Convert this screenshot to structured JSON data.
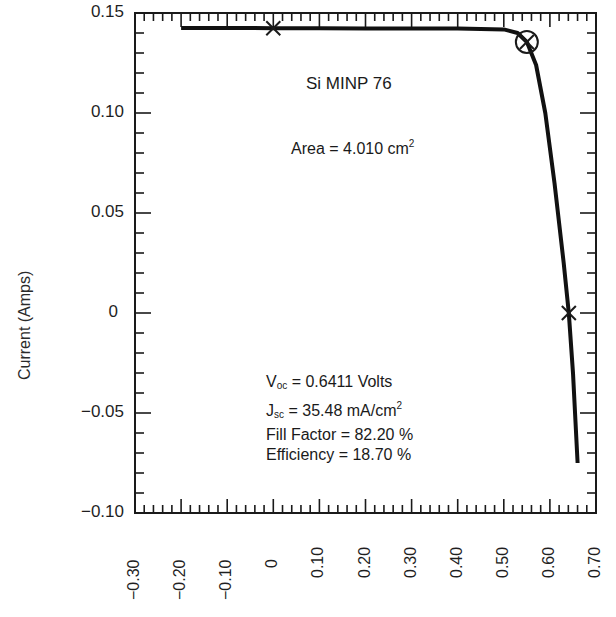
{
  "chart_data": {
    "type": "line",
    "title": "Si MINP 76",
    "xlabel": "",
    "ylabel": "Current (Amps)",
    "xlim": [
      -0.3,
      0.7
    ],
    "ylim": [
      -0.1,
      0.15
    ],
    "grid": false,
    "legend": null,
    "x_ticks": [
      "-0.30",
      "-0.20",
      "-0.10",
      "0",
      "0.10",
      "0.20",
      "0.30",
      "0.40",
      "0.50",
      "0.60",
      "0.70"
    ],
    "y_ticks": [
      "0.15",
      "0.10",
      "0.05",
      "0",
      "-0.05",
      "-0.10"
    ],
    "series": [
      {
        "name": "I-V curve",
        "x": [
          -0.2,
          -0.1,
          0.0,
          0.1,
          0.2,
          0.3,
          0.4,
          0.5,
          0.53,
          0.55,
          0.57,
          0.59,
          0.61,
          0.63,
          0.6411,
          0.65,
          0.66
        ],
        "y": [
          0.1425,
          0.1425,
          0.1424,
          0.1424,
          0.1423,
          0.1423,
          0.1422,
          0.1418,
          0.14,
          0.1355,
          0.124,
          0.1,
          0.065,
          0.025,
          0.0,
          -0.03,
          -0.075
        ]
      }
    ],
    "markers": [
      {
        "type": "x-cross",
        "x": 0.0,
        "y": 0.1424,
        "meaning": "Isc"
      },
      {
        "type": "circle-cross",
        "x": 0.55,
        "y": 0.1355,
        "meaning": "max power point"
      },
      {
        "type": "x-cross",
        "x": 0.6411,
        "y": 0.0,
        "meaning": "Voc"
      }
    ],
    "annotations": {
      "device": "Si MINP 76",
      "area": "Area = 4.010 cm²",
      "voc": "Voc = 0.6411 Volts",
      "jsc": "Jsc = 35.48 mA/cm²",
      "fill_factor": "Fill Factor = 82.20 %",
      "efficiency": "Efficiency = 18.70 %"
    }
  },
  "labels": {
    "ylabel": "Current (Amps)",
    "device": "Si MINP 76",
    "area_prefix": "Area = 4.010 cm",
    "area_sup": "2",
    "voc_main": "V",
    "voc_sub": "oc",
    "voc_val": " = 0.6411 Volts",
    "jsc_main": "J",
    "jsc_sub": "sc",
    "jsc_val": " = 35.48 mA/cm",
    "jsc_sup": "2",
    "ff": "Fill Factor = 82.20 %",
    "eff": "Efficiency = 18.70 %"
  },
  "colors": {
    "ink": "#1a1a1a",
    "background": "#ffffff"
  }
}
